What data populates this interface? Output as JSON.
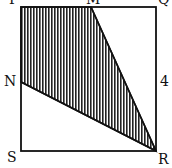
{
  "diagram": {
    "vertices": {
      "P": "P",
      "Q": "Q",
      "R": "R",
      "S": "S",
      "M": "M",
      "N": "N"
    },
    "side_label": "4",
    "shaded_region": "PMRN",
    "colors": {
      "stroke": "#111111",
      "hatch": "#222222",
      "background": "#ffffff"
    }
  }
}
